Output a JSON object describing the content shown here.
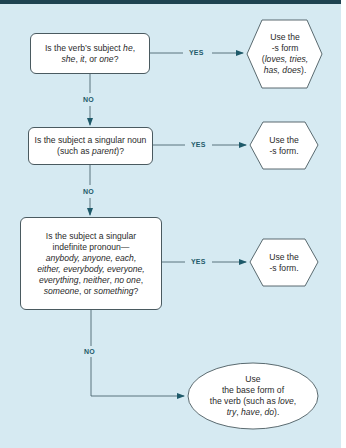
{
  "colors": {
    "background": "#d6eaf2",
    "topbar": "#1f4351",
    "line": "#3a5560",
    "arrow": "#1e5a6a",
    "label": "#1e5a6a",
    "box_fill": "#ffffff"
  },
  "labels": {
    "yes": "YES",
    "no": "NO"
  },
  "questions": [
    {
      "parts": [
        "Is the verb’s subject ",
        "he",
        ",",
        "she",
        ", ",
        "it",
        ", or ",
        "one",
        "?"
      ]
    },
    {
      "parts": [
        "Is the subject a singular noun",
        "(such as ",
        "parent",
        ")?"
      ]
    },
    {
      "parts": [
        "Is the subject a singular",
        "indefinite pronoun—",
        "anybody, anyone, each,",
        "either, everybody, everyone,",
        "everything",
        ", ",
        "neither",
        ", ",
        "no one",
        ",",
        "someone",
        ", or ",
        "something",
        "?"
      ]
    }
  ],
  "outcomes": [
    {
      "shape": "hexagon",
      "parts": [
        "Use the",
        "-s form",
        "(",
        "loves, tries,",
        "has, does",
        ")."
      ]
    },
    {
      "shape": "hexagon",
      "parts": [
        "Use the",
        "-s form."
      ]
    },
    {
      "shape": "hexagon",
      "parts": [
        "Use the",
        "-s form."
      ]
    },
    {
      "shape": "ellipse",
      "parts": [
        "Use",
        "the base form of",
        "the verb (such as ",
        "love",
        ",",
        "try",
        ", ",
        "have",
        ", ",
        "do",
        ")."
      ]
    }
  ]
}
